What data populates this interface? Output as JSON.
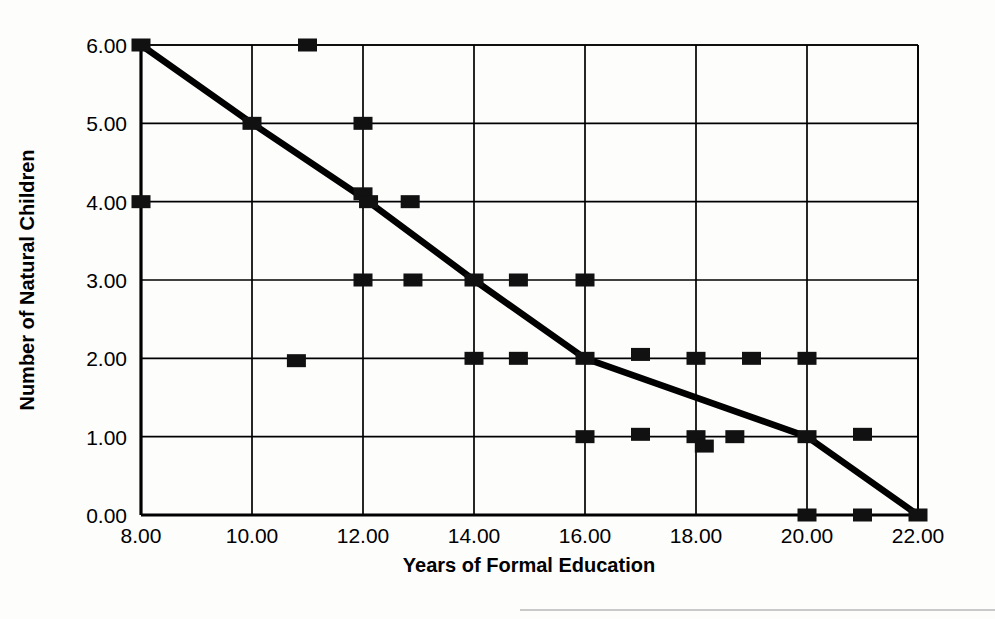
{
  "chart_data": {
    "type": "scatter",
    "title": "",
    "subtitle": "",
    "xlabel": "Years of Formal Education",
    "ylabel": "Number of Natural Children",
    "xlim": [
      8,
      22
    ],
    "ylim": [
      0,
      6
    ],
    "xticks": [
      8,
      10,
      12,
      14,
      16,
      18,
      20,
      22
    ],
    "xtick_labels": [
      "8.00",
      "10.00",
      "12.00",
      "14.00",
      "16.00",
      "18.00",
      "20.00",
      "22.00"
    ],
    "yticks": [
      0,
      1,
      2,
      3,
      4,
      5,
      6
    ],
    "ytick_labels": [
      "0.00",
      "1.00",
      "2.00",
      "3.00",
      "4.00",
      "5.00",
      "6.00"
    ],
    "grid": true,
    "legend": "none",
    "marker_style": "filled-square",
    "marker_color": "#111111",
    "line_color": "#000000",
    "points": [
      {
        "x": 8.0,
        "y": 6.0
      },
      {
        "x": 8.0,
        "y": 4.0
      },
      {
        "x": 11.0,
        "y": 6.0
      },
      {
        "x": 10.0,
        "y": 5.0
      },
      {
        "x": 12.0,
        "y": 5.0
      },
      {
        "x": 12.0,
        "y": 4.1
      },
      {
        "x": 12.1,
        "y": 4.0
      },
      {
        "x": 12.85,
        "y": 4.0
      },
      {
        "x": 12.0,
        "y": 3.0
      },
      {
        "x": 12.9,
        "y": 3.0
      },
      {
        "x": 14.0,
        "y": 3.0
      },
      {
        "x": 14.8,
        "y": 3.0
      },
      {
        "x": 16.0,
        "y": 3.0
      },
      {
        "x": 10.8,
        "y": 1.97
      },
      {
        "x": 14.0,
        "y": 2.0
      },
      {
        "x": 14.8,
        "y": 2.0
      },
      {
        "x": 16.0,
        "y": 2.0
      },
      {
        "x": 17.0,
        "y": 2.05
      },
      {
        "x": 18.0,
        "y": 2.0
      },
      {
        "x": 19.0,
        "y": 2.0
      },
      {
        "x": 20.0,
        "y": 2.0
      },
      {
        "x": 16.0,
        "y": 1.0
      },
      {
        "x": 17.0,
        "y": 1.03
      },
      {
        "x": 18.0,
        "y": 1.0
      },
      {
        "x": 18.15,
        "y": 0.88
      },
      {
        "x": 18.7,
        "y": 1.0
      },
      {
        "x": 20.0,
        "y": 1.0
      },
      {
        "x": 21.0,
        "y": 1.03
      },
      {
        "x": 20.0,
        "y": 0.0
      },
      {
        "x": 21.0,
        "y": 0.0
      },
      {
        "x": 22.0,
        "y": 0.0
      }
    ],
    "trend_line": [
      {
        "x": 8.0,
        "y": 6.0
      },
      {
        "x": 10.0,
        "y": 5.0
      },
      {
        "x": 12.0,
        "y": 4.05
      },
      {
        "x": 14.0,
        "y": 3.0
      },
      {
        "x": 16.0,
        "y": 2.0
      },
      {
        "x": 20.0,
        "y": 1.0
      },
      {
        "x": 22.0,
        "y": 0.0
      }
    ]
  }
}
